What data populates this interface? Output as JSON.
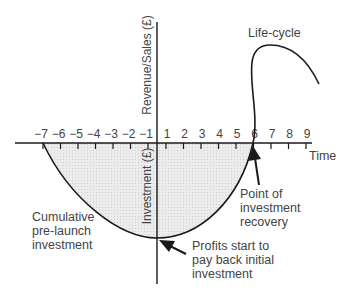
{
  "diagram": {
    "curve_label": "Life-cycle",
    "x_axis": {
      "label": "Time",
      "ticks": [
        "−7",
        "−6",
        "−5",
        "−4",
        "−3",
        "−2",
        "−1",
        "1",
        "2",
        "3",
        "4",
        "5",
        "6",
        "7",
        "8",
        "9"
      ]
    },
    "y_axis": {
      "upper_label": "Revenue/Sales (£)",
      "lower_label": "Investment (£)"
    },
    "annotations": {
      "pre_launch": [
        "Cumulative",
        "pre-launch",
        "investment"
      ],
      "recovery": [
        "Point of",
        "investment",
        "recovery"
      ],
      "payback": [
        "Profits start to",
        "pay back initial",
        "investment"
      ]
    },
    "colors": {
      "line": "#1a1a1a",
      "shading": "#e6e6e6",
      "text": "#444444"
    }
  }
}
